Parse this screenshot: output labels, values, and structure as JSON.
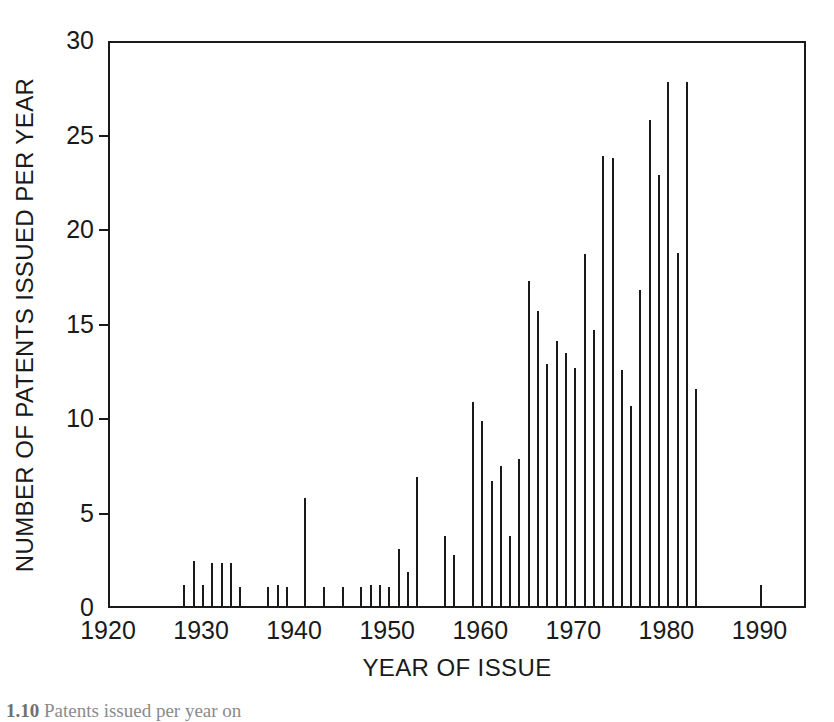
{
  "figure": {
    "caption_number": "1.10",
    "caption_text": "Patents issued per year on"
  },
  "chart_data": {
    "type": "bar",
    "title": "",
    "subtitle": "",
    "xlabel": "YEAR OF ISSUE",
    "ylabel": "NUMBER OF PATENTS ISSUED PER YEAR",
    "xlim": [
      1920,
      1995
    ],
    "ylim": [
      0,
      30
    ],
    "grid": false,
    "legend": null,
    "x_ticks": [
      1920,
      1930,
      1940,
      1950,
      1960,
      1970,
      1980,
      1990
    ],
    "x_tick_labels": [
      "1920",
      "1930",
      "1940",
      "1950",
      "1960",
      "1970",
      "1980",
      "1990"
    ],
    "y_ticks": [
      0,
      5,
      10,
      15,
      20,
      25,
      30
    ],
    "y_tick_labels": [
      "0",
      "5",
      "10",
      "15",
      "20",
      "25",
      "30"
    ],
    "bar_color": "#1a1a1a",
    "x": [
      1928,
      1929,
      1930,
      1931,
      1932,
      1933,
      1934,
      1937,
      1938,
      1939,
      1941,
      1943,
      1945,
      1947,
      1948,
      1949,
      1950,
      1951,
      1952,
      1953,
      1956,
      1957,
      1959,
      1960,
      1961,
      1962,
      1963,
      1964,
      1965,
      1966,
      1967,
      1968,
      1969,
      1970,
      1971,
      1972,
      1973,
      1974,
      1975,
      1976,
      1977,
      1978,
      1979,
      1980,
      1981,
      1982,
      1983,
      1990
    ],
    "values": [
      1.1,
      2.4,
      1.1,
      2.3,
      2.3,
      2.3,
      1.0,
      1.0,
      1.1,
      1.0,
      5.7,
      1.0,
      1.0,
      1.0,
      1.1,
      1.1,
      1.0,
      3.0,
      1.8,
      6.8,
      3.7,
      2.7,
      10.8,
      9.8,
      6.6,
      7.4,
      3.7,
      7.8,
      17.2,
      15.6,
      12.8,
      14.0,
      13.4,
      12.6,
      18.6,
      14.6,
      23.8,
      23.7,
      12.5,
      10.6,
      16.7,
      25.7,
      22.8,
      27.7,
      18.7,
      27.7,
      11.5,
      1.1
    ],
    "categories": [
      "1928",
      "1929",
      "1930",
      "1931",
      "1932",
      "1933",
      "1934",
      "1937",
      "1938",
      "1939",
      "1941",
      "1943",
      "1945",
      "1947",
      "1948",
      "1949",
      "1950",
      "1951",
      "1952",
      "1953",
      "1956",
      "1957",
      "1959",
      "1960",
      "1961",
      "1962",
      "1963",
      "1964",
      "1965",
      "1966",
      "1967",
      "1968",
      "1969",
      "1970",
      "1971",
      "1972",
      "1973",
      "1974",
      "1975",
      "1976",
      "1977",
      "1978",
      "1979",
      "1980",
      "1981",
      "1982",
      "1983",
      "1990"
    ]
  }
}
